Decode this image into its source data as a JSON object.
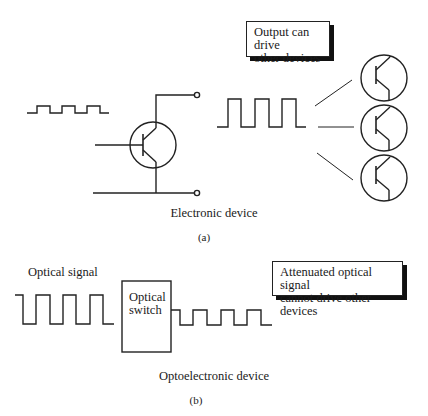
{
  "panel_a": {
    "callout": {
      "line1": "Output can drive",
      "line2": "other devices"
    },
    "caption": "Electronic device",
    "sublabel": "(a)",
    "components": [
      "input-square-wave",
      "transistor",
      "output-square-wave",
      "load-transistor-1",
      "load-transistor-2",
      "load-transistor-3"
    ]
  },
  "panel_b": {
    "signal_label": "Optical signal",
    "switch": {
      "line1": "Optical",
      "line2": "switch"
    },
    "callout": {
      "line1": "Attenuated optical signal",
      "line2": "cannot drive other devices"
    },
    "caption": "Optoelectronic device",
    "sublabel": "(b)",
    "components": [
      "optical-input-wave",
      "optical-switch-box",
      "attenuated-output-wave"
    ]
  },
  "colors": {
    "stroke": "#222222",
    "background": "#ffffff",
    "shadow": "#111111"
  }
}
